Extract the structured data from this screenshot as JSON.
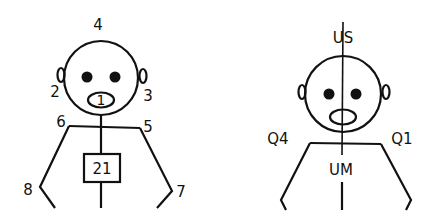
{
  "colors": {
    "stroke": "#111111",
    "background": "#ffffff"
  },
  "left_figure": {
    "labels": {
      "top": "4",
      "left_ear": "2",
      "right_ear": "3",
      "mouth": "1",
      "left_shoulder": "6",
      "right_shoulder": "5",
      "chest_box": "21",
      "left_hand": "8",
      "right_hand": "7"
    }
  },
  "right_figure": {
    "labels": {
      "top": "US",
      "left_shoulder": "Q4",
      "right_shoulder": "Q1",
      "center": "UM"
    }
  }
}
